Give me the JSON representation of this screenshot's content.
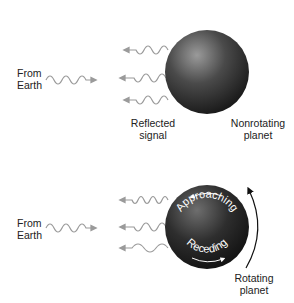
{
  "diagram": {
    "top_panel": {
      "source_label": "From\nEarth",
      "source_line1": "From",
      "source_line2": "Earth",
      "reflected_line1": "Reflected",
      "reflected_line2": "signal",
      "planet_line1": "Nonrotating",
      "planet_line2": "planet"
    },
    "bottom_panel": {
      "source_line1": "From",
      "source_line2": "Earth",
      "approaching_label": "Approaching",
      "receding_label": "Receding",
      "planet_line1": "Rotating",
      "planet_line2": "planet"
    },
    "colors": {
      "wave": "#9a9a9a",
      "planet_dark": "#1c1c1c",
      "planet_light": "#8a8a8a",
      "text": "#222222",
      "rotation_arrow": "#111111"
    }
  }
}
